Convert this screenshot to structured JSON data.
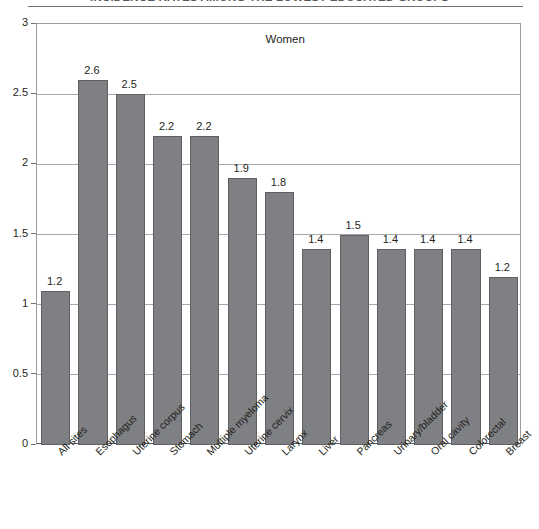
{
  "figure": {
    "title_cropped": "INCIDENCE RATES AMONG THE LOWEST-EDUCATED GROUPS",
    "series_label": "Women"
  },
  "chart_data": {
    "type": "bar",
    "title": "Women",
    "xlabel": "",
    "ylabel": "",
    "ylim": [
      0,
      3
    ],
    "yticks": [
      "0",
      "0.5",
      "1",
      "1.5",
      "2",
      "2.5",
      "3"
    ],
    "ytick_values": [
      0,
      0.5,
      1,
      1.5,
      2,
      2.5,
      3
    ],
    "grid": true,
    "legend": "none",
    "categories": [
      "All sites",
      "Esophagus",
      "Uterine corpus",
      "Stomach",
      "Multiple myeloma",
      "Uterine cervix",
      "Larynx",
      "Liver",
      "Pancreas",
      "Urinary/bladder",
      "Oral cavity",
      "Colorectal",
      "Breast"
    ],
    "values": [
      1.1,
      2.6,
      2.5,
      2.2,
      2.2,
      1.9,
      1.8,
      1.4,
      1.5,
      1.4,
      1.4,
      1.4,
      1.2
    ],
    "data_labels": [
      "1.2",
      "2.6",
      "2.5",
      "2.2",
      "2.2",
      "1.9",
      "1.8",
      "1.4",
      "1.5",
      "1.4",
      "1.4",
      "1.4",
      "1.2"
    ],
    "bar_color": "#7f8083",
    "bar_edge_color": "#5e6063",
    "grid_color": "#a7aaad",
    "axis_color": "#58595b"
  }
}
